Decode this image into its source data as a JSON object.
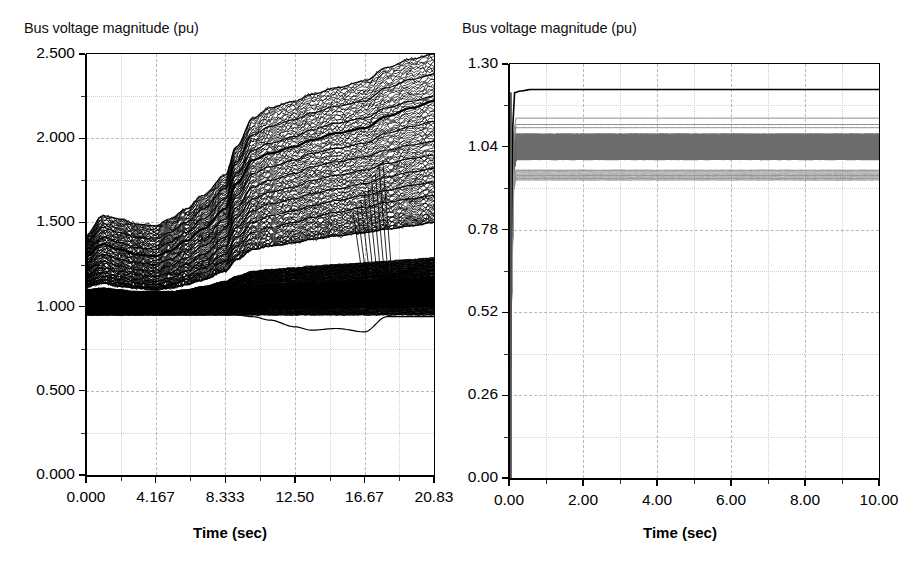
{
  "figure": {
    "background": "#ffffff",
    "grid_color": "#b9b9b9",
    "axis_color": "#000000"
  },
  "panels": [
    {
      "id": "left",
      "ylabel_text": "Bus voltage magnitude (pu)",
      "xlabel_text": "Time (sec)",
      "yticks": [
        "0.000",
        "0.500",
        "1.000",
        "1.500",
        "2.000",
        "2.500"
      ],
      "xticks": [
        "0.000",
        "4.167",
        "8.333",
        "12.50",
        "16.67",
        "20.83"
      ]
    },
    {
      "id": "right",
      "ylabel_text": "Bus voltage magnitude (pu)",
      "xlabel_text": "Time (sec)",
      "yticks": [
        "0.00",
        "0.26",
        "0.52",
        "0.78",
        "1.04",
        "1.30"
      ],
      "xticks": [
        "0.00",
        "2.00",
        "4.00",
        "6.00",
        "8.00",
        "10.00"
      ]
    }
  ],
  "chart_data": [
    {
      "type": "line",
      "panel": "left",
      "title": "",
      "xlabel": "Time (sec)",
      "ylabel": "Bus voltage magnitude (pu)",
      "xlim": [
        0.0,
        20.83
      ],
      "ylim": [
        0.0,
        2.5
      ],
      "xticks": [
        0.0,
        4.167,
        8.333,
        12.5,
        16.67,
        20.83
      ],
      "yticks": [
        0.0,
        0.5,
        1.0,
        1.5,
        2.0,
        2.5
      ],
      "grid": true,
      "grid_style": "dashed",
      "legend": "none",
      "line_color": "#000000",
      "description": "Several hundred bus voltage traces. A very dense black band sits just above 1.00 pu for the whole run; above it a fan of traces drifts upward in a staircase, climbing steeply between about 8 s and 12 s, with the top envelope reaching 2.5 pu at 20.83 s. One trace dips below the band to about 0.85 pu near 15-17 s.",
      "x": [
        0.0,
        1.0,
        2.0,
        3.0,
        4.167,
        5.0,
        6.0,
        7.0,
        8.333,
        9.0,
        10.0,
        11.0,
        12.5,
        13.5,
        15.0,
        16.67,
        18.0,
        19.5,
        20.83
      ],
      "series": [
        {
          "name": "envelope-max",
          "values": [
            1.42,
            1.54,
            1.52,
            1.49,
            1.48,
            1.52,
            1.58,
            1.66,
            1.78,
            1.95,
            2.12,
            2.18,
            2.22,
            2.26,
            2.3,
            2.34,
            2.42,
            2.47,
            2.5
          ]
        },
        {
          "name": "upper-2",
          "values": [
            1.38,
            1.47,
            1.44,
            1.41,
            1.4,
            1.44,
            1.5,
            1.58,
            1.7,
            1.86,
            2.02,
            2.07,
            2.11,
            2.15,
            2.19,
            2.22,
            2.3,
            2.35,
            2.38
          ]
        },
        {
          "name": "upper-3",
          "values": [
            1.34,
            1.41,
            1.38,
            1.35,
            1.34,
            1.38,
            1.44,
            1.52,
            1.64,
            1.79,
            1.93,
            1.97,
            2.01,
            2.05,
            2.09,
            2.12,
            2.18,
            2.22,
            2.25
          ]
        },
        {
          "name": "upper-4-bold",
          "values": [
            1.3,
            1.37,
            1.34,
            1.31,
            1.3,
            1.33,
            1.39,
            1.46,
            1.58,
            1.73,
            1.87,
            1.91,
            1.95,
            1.99,
            2.03,
            2.06,
            2.13,
            2.18,
            2.22
          ]
        },
        {
          "name": "upper-5",
          "values": [
            1.26,
            1.31,
            1.28,
            1.26,
            1.25,
            1.28,
            1.33,
            1.4,
            1.52,
            1.66,
            1.79,
            1.83,
            1.87,
            1.91,
            1.94,
            1.97,
            2.03,
            2.07,
            2.1
          ]
        },
        {
          "name": "mid-6",
          "values": [
            1.22,
            1.27,
            1.24,
            1.22,
            1.21,
            1.24,
            1.29,
            1.36,
            1.46,
            1.59,
            1.71,
            1.75,
            1.79,
            1.83,
            1.86,
            1.89,
            1.93,
            1.96,
            1.98
          ]
        },
        {
          "name": "mid-7",
          "values": [
            1.19,
            1.23,
            1.21,
            1.19,
            1.18,
            1.2,
            1.25,
            1.31,
            1.41,
            1.53,
            1.64,
            1.68,
            1.71,
            1.75,
            1.78,
            1.81,
            1.85,
            1.88,
            1.9
          ]
        },
        {
          "name": "mid-8",
          "values": [
            1.17,
            1.2,
            1.18,
            1.16,
            1.15,
            1.17,
            1.21,
            1.27,
            1.36,
            1.47,
            1.57,
            1.61,
            1.64,
            1.67,
            1.7,
            1.73,
            1.77,
            1.8,
            1.82
          ]
        },
        {
          "name": "mid-9",
          "values": [
            1.15,
            1.18,
            1.16,
            1.14,
            1.13,
            1.15,
            1.18,
            1.23,
            1.31,
            1.41,
            1.5,
            1.54,
            1.57,
            1.6,
            1.63,
            1.66,
            1.69,
            1.72,
            1.74
          ]
        },
        {
          "name": "mid-10",
          "values": [
            1.13,
            1.16,
            1.14,
            1.12,
            1.11,
            1.13,
            1.16,
            1.2,
            1.27,
            1.36,
            1.44,
            1.47,
            1.5,
            1.53,
            1.56,
            1.59,
            1.62,
            1.64,
            1.66
          ]
        },
        {
          "name": "band-top",
          "values": [
            1.12,
            1.14,
            1.12,
            1.11,
            1.1,
            1.11,
            1.13,
            1.16,
            1.21,
            1.28,
            1.34,
            1.36,
            1.38,
            1.4,
            1.42,
            1.44,
            1.46,
            1.48,
            1.5
          ]
        },
        {
          "name": "dense-band-upper-edge",
          "values": [
            1.1,
            1.11,
            1.1,
            1.09,
            1.09,
            1.09,
            1.1,
            1.12,
            1.15,
            1.18,
            1.21,
            1.22,
            1.23,
            1.24,
            1.25,
            1.26,
            1.27,
            1.28,
            1.29
          ]
        },
        {
          "name": "dense-band-core",
          "values": [
            1.02,
            1.03,
            1.02,
            1.02,
            1.02,
            1.02,
            1.03,
            1.03,
            1.04,
            1.05,
            1.06,
            1.06,
            1.06,
            1.06,
            1.07,
            1.07,
            1.07,
            1.07,
            1.07
          ]
        },
        {
          "name": "dense-band-lower-edge",
          "values": [
            0.95,
            0.95,
            0.95,
            0.95,
            0.95,
            0.95,
            0.95,
            0.95,
            0.95,
            0.95,
            0.95,
            0.95,
            0.95,
            0.95,
            0.95,
            0.95,
            0.95,
            0.95,
            0.95
          ]
        },
        {
          "name": "dipping-trace",
          "values": [
            0.95,
            0.95,
            0.95,
            0.95,
            0.95,
            0.95,
            0.95,
            0.95,
            0.95,
            0.95,
            0.94,
            0.92,
            0.88,
            0.86,
            0.87,
            0.85,
            0.94,
            0.94,
            0.94
          ]
        }
      ]
    },
    {
      "type": "line",
      "panel": "right",
      "title": "",
      "xlabel": "Time (sec)",
      "ylabel": "Bus voltage magnitude (pu)",
      "xlim": [
        0.0,
        10.0
      ],
      "ylim": [
        0.0,
        1.3
      ],
      "xticks": [
        0.0,
        2.0,
        4.0,
        6.0,
        8.0,
        10.0
      ],
      "yticks": [
        0.0,
        0.26,
        0.52,
        0.78,
        1.04,
        1.3
      ],
      "grid": true,
      "grid_style": "dashed",
      "legend": "none",
      "line_color": "#000000",
      "band_color": "#6e6e6e",
      "description": "All traces start at 0 pu, jump almost vertically within the first ~0.15 s, and then hold flat for the remaining 10 s. A solid dark trace settles near 1.22 pu, a dense grey band fills roughly 1.00-1.08 pu, and a thinner group of traces settles near 0.94-0.96 pu.",
      "x": [
        0.0,
        0.05,
        0.1,
        0.15,
        0.3,
        0.6,
        1.0,
        2.0,
        4.0,
        6.0,
        8.0,
        10.0
      ],
      "series": [
        {
          "name": "top-dark-trace",
          "values": [
            0.0,
            0.6,
            1.1,
            1.21,
            1.215,
            1.22,
            1.22,
            1.22,
            1.22,
            1.22,
            1.22,
            1.22
          ]
        },
        {
          "name": "upper-group-a",
          "values": [
            0.0,
            0.55,
            1.03,
            1.13,
            1.13,
            1.13,
            1.13,
            1.13,
            1.13,
            1.13,
            1.13,
            1.13
          ]
        },
        {
          "name": "upper-group-b",
          "values": [
            0.0,
            0.54,
            1.01,
            1.11,
            1.11,
            1.11,
            1.11,
            1.11,
            1.11,
            1.11,
            1.11,
            1.11
          ]
        },
        {
          "name": "upper-group-c",
          "values": [
            0.0,
            0.53,
            1.0,
            1.1,
            1.1,
            1.1,
            1.1,
            1.1,
            1.1,
            1.1,
            1.1,
            1.1
          ]
        },
        {
          "name": "band-top",
          "values": [
            0.0,
            0.52,
            0.99,
            1.08,
            1.08,
            1.08,
            1.08,
            1.08,
            1.08,
            1.08,
            1.08,
            1.08
          ]
        },
        {
          "name": "band-core",
          "values": [
            0.0,
            0.5,
            0.96,
            1.04,
            1.04,
            1.04,
            1.04,
            1.04,
            1.04,
            1.04,
            1.04,
            1.04
          ]
        },
        {
          "name": "band-bottom",
          "values": [
            0.0,
            0.48,
            0.92,
            1.0,
            1.0,
            1.0,
            1.0,
            1.0,
            1.0,
            1.0,
            1.0,
            1.0
          ]
        },
        {
          "name": "lower-group-a",
          "values": [
            0.0,
            0.46,
            0.89,
            0.965,
            0.965,
            0.965,
            0.965,
            0.965,
            0.965,
            0.965,
            0.965,
            0.965
          ]
        },
        {
          "name": "lower-group-b",
          "values": [
            0.0,
            0.45,
            0.87,
            0.95,
            0.95,
            0.95,
            0.95,
            0.95,
            0.95,
            0.95,
            0.95,
            0.95
          ]
        },
        {
          "name": "lower-group-c",
          "values": [
            0.0,
            0.44,
            0.86,
            0.94,
            0.94,
            0.94,
            0.94,
            0.94,
            0.94,
            0.94,
            0.94,
            0.94
          ]
        }
      ]
    }
  ]
}
